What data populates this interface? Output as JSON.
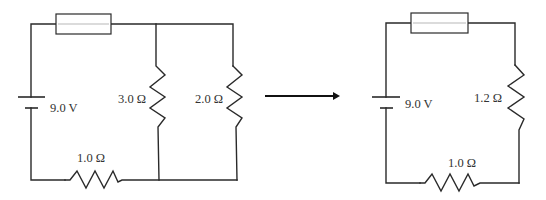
{
  "diagram": {
    "type": "circuit-simplification",
    "left_circuit": {
      "battery": {
        "label": "9.0 V"
      },
      "fuse": {
        "label": ""
      },
      "resistors": [
        {
          "id": "R_series",
          "label": "1.0 Ω",
          "position": "bottom"
        },
        {
          "id": "R_parallel_1",
          "label": "3.0 Ω",
          "position": "middle-branch"
        },
        {
          "id": "R_parallel_2",
          "label": "2.0 Ω",
          "position": "right-branch"
        }
      ]
    },
    "arrow": {
      "direction": "right"
    },
    "right_circuit": {
      "battery": {
        "label": "9.0 V"
      },
      "fuse": {
        "label": ""
      },
      "resistors": [
        {
          "id": "R_equivalent",
          "label": "1.2 Ω",
          "position": "right"
        },
        {
          "id": "R_series",
          "label": "1.0 Ω",
          "position": "bottom"
        }
      ]
    },
    "colors": {
      "line": "#2a2a2a",
      "text": "#333333",
      "background": "#ffffff"
    }
  }
}
